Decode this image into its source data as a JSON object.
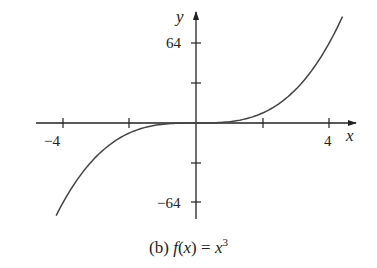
{
  "chart_data": {
    "type": "line",
    "function": "x^3",
    "xlabel": "x",
    "ylabel": "y",
    "xlim": [
      -4.2,
      4.4
    ],
    "ylim": [
      -74,
      85
    ],
    "x_ticks": [
      -4,
      -2,
      0,
      2,
      4
    ],
    "x_tick_labels": [
      "-4",
      "",
      "",
      "",
      "4"
    ],
    "y_ticks": [
      -64,
      -32,
      0,
      32,
      64
    ],
    "y_tick_labels": [
      "-64",
      "",
      "",
      "",
      "64"
    ],
    "grid": false,
    "legend": null,
    "series": [
      {
        "name": "f(x) = x^3",
        "x": [
          -4.2,
          -4,
          -3,
          -2,
          -1,
          0,
          1,
          2,
          3,
          4,
          4.4
        ],
        "values": [
          -74.1,
          -64,
          -27,
          -8,
          -1,
          0,
          1,
          8,
          27,
          64,
          85.2
        ]
      }
    ]
  },
  "labels": {
    "x_axis": "x",
    "y_axis": "y",
    "x_tick_neg4": "−4",
    "x_tick_4": "4",
    "y_tick_64": "64",
    "y_tick_neg64": "−64"
  },
  "caption": {
    "prefix": "(b) ",
    "fn": "f",
    "arg_open": "(",
    "arg": "x",
    "arg_close": ")",
    "equals": " = ",
    "base": "x",
    "exponent": "3"
  }
}
